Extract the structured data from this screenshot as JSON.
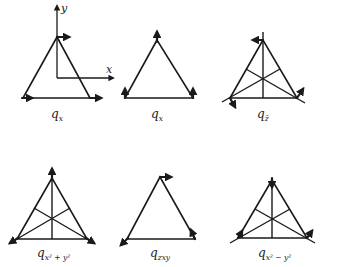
{
  "figure": {
    "axes": {
      "x_label": "x",
      "y_label": "y"
    },
    "panels": [
      {
        "id": "p1",
        "label_main": "q",
        "label_sub": "x",
        "description": "x-translation: all three vertex vectors point +x; coordinate axes shown"
      },
      {
        "id": "p2",
        "label_main": "q",
        "label_sub": "x",
        "description": "vertex vectors point +y (up)"
      },
      {
        "id": "p3",
        "label_main": "q",
        "label_sub": "z̄",
        "description": "rotation-like vectors at vertices, medians drawn"
      },
      {
        "id": "p4",
        "label_main": "q",
        "label_sub": "x² + y²",
        "description": "breathing mode: radial outward vectors, medians drawn"
      },
      {
        "id": "p5",
        "label_main": "q",
        "label_sub": "zxy",
        "description": "mixed vertex displacement vectors"
      },
      {
        "id": "p6",
        "label_main": "q",
        "label_sub": "x² − y²",
        "description": "deformation mode, medians drawn"
      }
    ]
  }
}
